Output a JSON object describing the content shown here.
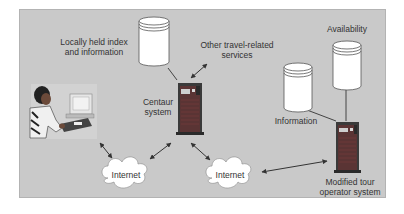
{
  "diagram": {
    "colors": {
      "background": "#ffffff",
      "panel": "#c9c9c9",
      "server_body": "#3a3a3a",
      "server_panel": "#a23b3b",
      "cylinder_fill": "#ffffff",
      "cloud_fill": "#ffffff",
      "text": "#333333",
      "arrow": "#333333"
    },
    "nodes": {
      "user": {
        "label": ""
      },
      "local_db": {
        "label_line1": "Locally held index",
        "label_line2": "and information"
      },
      "other_services": {
        "label_line1": "Other travel-related",
        "label_line2": "services"
      },
      "centaur": {
        "label_line1": "Centaur",
        "label_line2": "system"
      },
      "internet_left": {
        "label": "Internet"
      },
      "internet_right": {
        "label": "Internet"
      },
      "info_db": {
        "label": "Information"
      },
      "availability_db": {
        "label": "Availability"
      },
      "tour_operator": {
        "label_line1": "Modified tour",
        "label_line2": "operator system"
      }
    },
    "edges": [
      {
        "from": "user",
        "to": "internet_left",
        "type": "bidirectional"
      },
      {
        "from": "internet_left",
        "to": "centaur",
        "type": "bidirectional"
      },
      {
        "from": "centaur",
        "to": "internet_right",
        "type": "bidirectional"
      },
      {
        "from": "centaur",
        "to": "other_services",
        "type": "bidirectional"
      },
      {
        "from": "local_db",
        "to": "centaur",
        "type": "line"
      },
      {
        "from": "internet_right",
        "to": "tour_operator",
        "type": "bidirectional"
      },
      {
        "from": "info_db",
        "to": "tour_operator",
        "type": "line"
      },
      {
        "from": "availability_db",
        "to": "tour_operator",
        "type": "line"
      }
    ]
  }
}
